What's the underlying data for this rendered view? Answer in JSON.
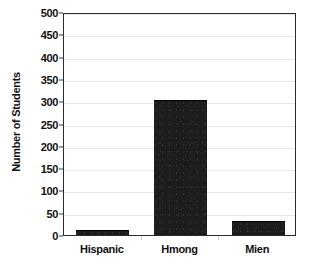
{
  "chart_data": {
    "type": "bar",
    "title": "",
    "xlabel": "",
    "ylabel": "Number of Students",
    "categories": [
      "Hispanic",
      "Hmong",
      "Mien"
    ],
    "values": [
      8,
      300,
      30
    ],
    "series": [
      {
        "name": "Number of Students",
        "values": [
          8,
          300,
          30
        ]
      }
    ],
    "ylim": [
      0,
      500
    ],
    "ytick_step": 50,
    "ytick_labels": [
      "0",
      "50",
      "100",
      "150",
      "200",
      "250",
      "300",
      "350",
      "400",
      "450",
      "500"
    ],
    "ytick_values": [
      0,
      50,
      100,
      150,
      200,
      250,
      300,
      350,
      400,
      450,
      500
    ],
    "grid": true,
    "grid_axis": "y",
    "legend": false,
    "legend_position": "none",
    "bar_color": "#1c1c1c",
    "grid_color": "#e8e8e8",
    "axis_color": "#2b2b2b",
    "text_color": "#111111",
    "background_color": "#ffffff"
  }
}
